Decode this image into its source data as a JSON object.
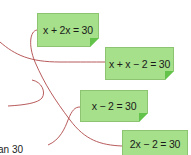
{
  "cards": [
    {
      "label": "x + 2x = 30"
    },
    {
      "label": "x + x − 2 = 30"
    },
    {
      "label": "x − 2 = 30"
    },
    {
      "label": "2x − 2 = 30"
    }
  ],
  "partial_text": "an 30",
  "colors": {
    "card": "#a6e08a",
    "fold": "#62c24a",
    "line": "#b0484a"
  }
}
